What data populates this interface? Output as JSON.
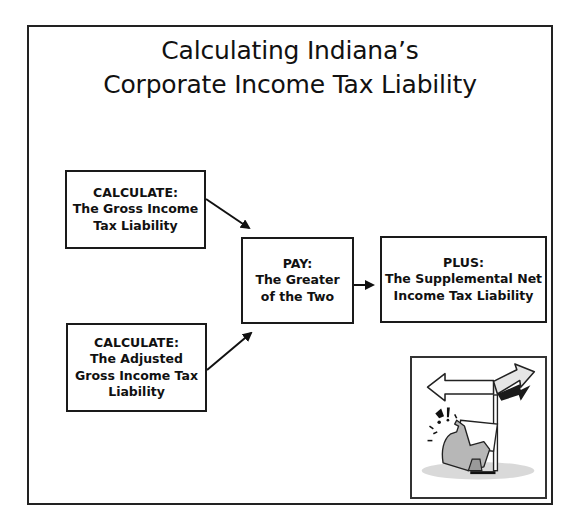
{
  "title": {
    "line1": "Calculating Indiana’s",
    "line2": "Corporate Income Tax Liability"
  },
  "boxes": {
    "gross": {
      "lines": [
        "CALCULATE:",
        "The Gross Income",
        "Tax Liability"
      ]
    },
    "agi": {
      "lines": [
        "CALCULATE:",
        "The Adjusted",
        "Gross Income Tax",
        "Liability"
      ]
    },
    "pay": {
      "lines": [
        "PAY:",
        "The Greater",
        "of the Two"
      ]
    },
    "plus": {
      "lines": [
        "PLUS:",
        "The Supplemental Net",
        "Income Tax Liability"
      ]
    }
  },
  "flow": [
    {
      "from": "gross",
      "to": "pay"
    },
    {
      "from": "agi",
      "to": "pay"
    },
    {
      "from": "pay",
      "to": "plus"
    }
  ],
  "illustration": {
    "icon": "confused-figure-at-signpost-icon",
    "description": "Clip art of a person holding a paper, confused at a two-way signpost"
  },
  "colors": {
    "line": "#1a1a1a",
    "background": "#ffffff",
    "text": "#111111"
  }
}
